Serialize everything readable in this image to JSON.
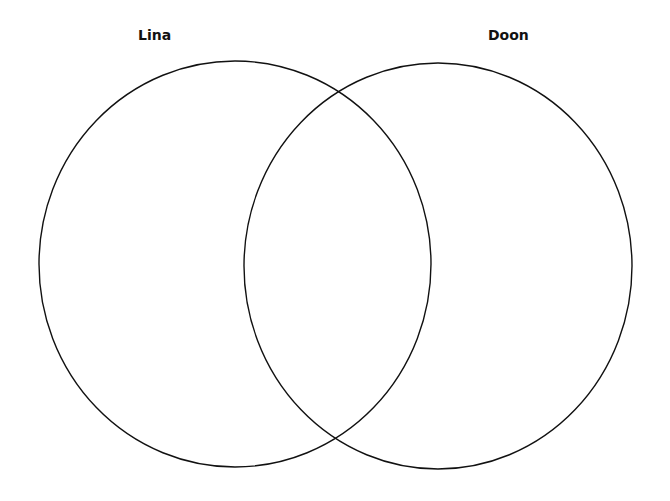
{
  "diagram": {
    "type": "venn",
    "sets": [
      {
        "label": "Lina",
        "cx": 235,
        "cy": 264,
        "rx": 196,
        "ry": 203
      },
      {
        "label": "Doon",
        "cx": 438,
        "cy": 266,
        "rx": 194,
        "ry": 203
      }
    ],
    "stroke_color": "#111111",
    "background": "#ffffff"
  }
}
